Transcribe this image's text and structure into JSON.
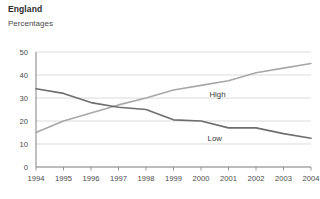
{
  "header": {
    "title": "England",
    "subtitle": "Percentages"
  },
  "chart_data": {
    "type": "line",
    "title": "England",
    "subtitle": "Percentages",
    "xlabel": "",
    "ylabel": "Percentages",
    "categories": [
      "1994",
      "1995",
      "1996",
      "1997",
      "1998",
      "1999",
      "2000",
      "2001",
      "2002",
      "2003",
      "2004"
    ],
    "x": [
      1994,
      1995,
      1996,
      1997,
      1998,
      1999,
      2000,
      2001,
      2002,
      2003,
      2004
    ],
    "ylim": [
      0,
      50
    ],
    "xlim": [
      1994,
      2004
    ],
    "yticks": [
      0,
      10,
      20,
      30,
      40,
      50
    ],
    "ytick_labels": [
      "0",
      "10",
      "20",
      "30",
      "40",
      "50"
    ],
    "xtick_labels": [
      "1994",
      "1995",
      "1996",
      "1997",
      "1998",
      "1999",
      "2000",
      "2001",
      "2002",
      "2003",
      "2004"
    ],
    "grid": "horizontal",
    "legend_position": "inline-labels",
    "series": [
      {
        "name": "High",
        "color": "#a8a8a8",
        "values": [
          15,
          20,
          23.5,
          27,
          30,
          33.5,
          35.5,
          37.5,
          41,
          43,
          45
        ],
        "label_x": 2000.6,
        "label_y": 30.5
      },
      {
        "name": "Low",
        "color": "#6e6e6e",
        "values": [
          34,
          32,
          28,
          26,
          25,
          20.5,
          20,
          17,
          17,
          14.5,
          12.5
        ],
        "label_x": 2000.5,
        "label_y": 11.5
      }
    ]
  },
  "colors": {
    "axis": "#8c8c8c",
    "grid": "#d2d2d2",
    "high_series": "#a8a8a8",
    "low_series": "#6e6e6e",
    "text": "#3b3b3b",
    "background": "#ffffff"
  }
}
